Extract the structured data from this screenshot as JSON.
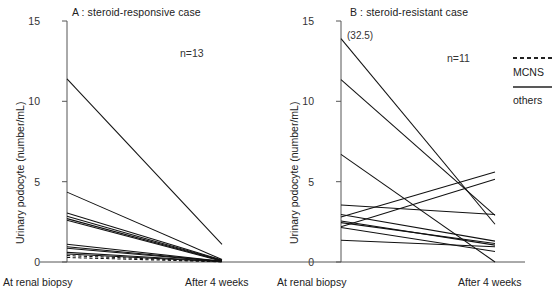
{
  "figure": {
    "background": "#ffffff",
    "line_color": "#111111",
    "axis_color": "#555555"
  },
  "legend": {
    "position": "right",
    "entries": [
      {
        "label": "MCNS",
        "style": "dashed",
        "swatch": "dashed-line-swatch"
      },
      {
        "label": "others",
        "style": "solid",
        "swatch": "solid-line-swatch"
      }
    ]
  },
  "chart_data": [
    {
      "id": "panel-a",
      "type": "line",
      "title": "A : steroid-responsive case",
      "annotation": "n=13",
      "n": 13,
      "xlabel": "",
      "ylabel": "Urinary podocyte (number/mL)",
      "categories": [
        "At renal biopsy",
        "After 4 weeks"
      ],
      "x": [
        0,
        1
      ],
      "ylim": [
        0,
        15
      ],
      "yticks": [
        0,
        5,
        10,
        15
      ],
      "ytick_labels": [
        "0",
        "5",
        "10",
        "15"
      ],
      "grid": false,
      "series": [
        {
          "name": "A1",
          "group": "others",
          "style": "solid",
          "values": [
            11.4,
            1.1
          ]
        },
        {
          "name": "A2",
          "group": "others",
          "style": "solid",
          "values": [
            4.35,
            0.15
          ]
        },
        {
          "name": "A3",
          "group": "others",
          "style": "solid",
          "values": [
            3.05,
            0.12
          ]
        },
        {
          "name": "A4",
          "group": "others",
          "style": "solid",
          "values": [
            2.85,
            0.1
          ]
        },
        {
          "name": "A5",
          "group": "others",
          "style": "solid",
          "values": [
            2.7,
            0.08
          ]
        },
        {
          "name": "A6",
          "group": "others",
          "style": "solid",
          "values": [
            2.6,
            0.05
          ]
        },
        {
          "name": "A7",
          "group": "others",
          "style": "solid",
          "values": [
            1.1,
            0.05
          ]
        },
        {
          "name": "A8",
          "group": "others",
          "style": "solid",
          "values": [
            0.95,
            0.04
          ]
        },
        {
          "name": "A9",
          "group": "others",
          "style": "solid",
          "values": [
            0.85,
            0.03
          ]
        },
        {
          "name": "A10",
          "group": "others",
          "style": "solid",
          "values": [
            0.6,
            0.03
          ]
        },
        {
          "name": "A11",
          "group": "others",
          "style": "solid",
          "values": [
            0.5,
            0.02
          ]
        },
        {
          "name": "A12",
          "group": "MCNS",
          "style": "dashed",
          "values": [
            0.4,
            0.02
          ]
        },
        {
          "name": "A13",
          "group": "MCNS",
          "style": "dashed",
          "values": [
            0.28,
            0.01
          ]
        }
      ]
    },
    {
      "id": "panel-b",
      "type": "line",
      "title": "B : steroid-resistant case",
      "annotation": "n=11",
      "n": 11,
      "xlabel": "",
      "ylabel": "Urinary podocyte (number/mL)",
      "categories": [
        "At renal biopsy",
        "After 4 weeks"
      ],
      "x": [
        0,
        1
      ],
      "ylim": [
        0,
        15
      ],
      "yticks": [
        0,
        5,
        10,
        15
      ],
      "ytick_labels": [
        "0",
        "5",
        "10",
        "15"
      ],
      "grid": false,
      "point_annotations": [
        {
          "text": "(32.5)",
          "series": "B1",
          "note": "off-scale start value for top line"
        }
      ],
      "series": [
        {
          "name": "B1",
          "group": "others",
          "style": "solid",
          "values": [
            13.9,
            2.35
          ]
        },
        {
          "name": "B2",
          "group": "others",
          "style": "solid",
          "values": [
            11.35,
            2.9
          ]
        },
        {
          "name": "B3",
          "group": "others",
          "style": "solid",
          "values": [
            6.7,
            0.0
          ]
        },
        {
          "name": "B4",
          "group": "others",
          "style": "solid",
          "values": [
            3.55,
            2.95
          ]
        },
        {
          "name": "B5",
          "group": "others",
          "style": "solid",
          "values": [
            2.95,
            1.3
          ]
        },
        {
          "name": "B6",
          "group": "others",
          "style": "solid",
          "values": [
            2.8,
            5.6
          ]
        },
        {
          "name": "B7",
          "group": "others",
          "style": "solid",
          "values": [
            2.55,
            1.05
          ]
        },
        {
          "name": "B8",
          "group": "others",
          "style": "solid",
          "values": [
            2.45,
            1.15
          ]
        },
        {
          "name": "B9",
          "group": "others",
          "style": "solid",
          "values": [
            2.2,
            5.15
          ]
        },
        {
          "name": "B10",
          "group": "others",
          "style": "solid",
          "values": [
            2.15,
            0.65
          ]
        },
        {
          "name": "B11",
          "group": "others",
          "style": "solid",
          "values": [
            1.35,
            0.95
          ]
        }
      ]
    }
  ]
}
